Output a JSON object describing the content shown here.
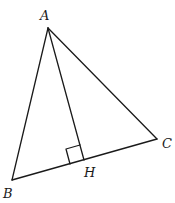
{
  "diagram": {
    "type": "triangle-with-altitude",
    "points": {
      "A": {
        "label": "A",
        "x": 48,
        "y": 28
      },
      "B": {
        "label": "B",
        "x": 12,
        "y": 180
      },
      "C": {
        "label": "C",
        "x": 157,
        "y": 139
      },
      "H": {
        "label": "H",
        "x": 84,
        "y": 160
      }
    },
    "segments": [
      "AB",
      "AC",
      "BC",
      "AH"
    ],
    "right_angle_at": "H",
    "labels": {
      "A": "A",
      "B": "B",
      "C": "C",
      "H": "H"
    }
  }
}
